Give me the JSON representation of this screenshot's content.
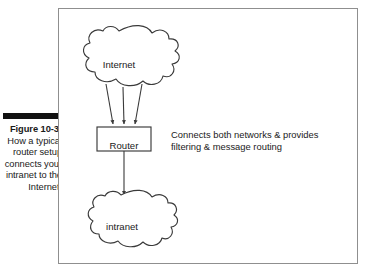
{
  "caption": {
    "figure_number": "Figure 10-3:",
    "body": " How a typical router setup connects your intranet to the Internet."
  },
  "figure": {
    "nodes": {
      "internet_cloud_label": "Internet",
      "router_box_label": "Router",
      "intranet_cloud_label": "intranet"
    },
    "annotation": {
      "line1": "Connects both networks & provides",
      "line2": "filtering & message routing"
    }
  },
  "colors": {
    "frame_border": "#8f8f8f",
    "shape_stroke": "#3a3a3a",
    "text": "#1a1a1a",
    "caption_rule": "#111111",
    "background": "#ffffff"
  }
}
